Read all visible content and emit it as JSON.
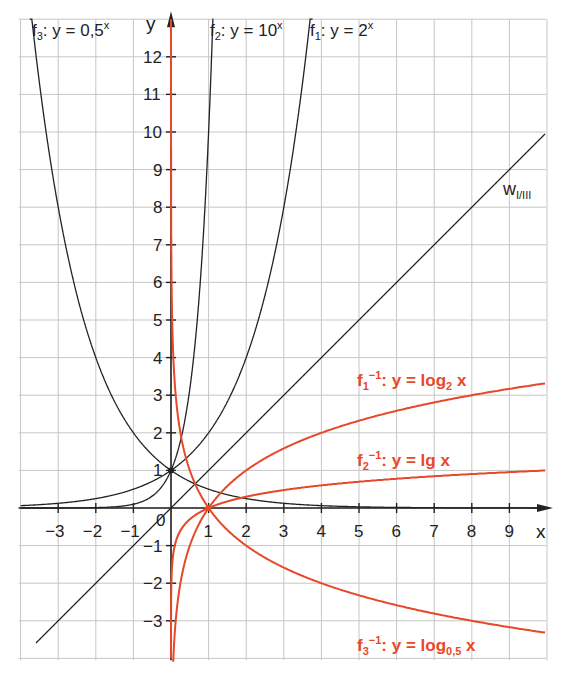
{
  "chart_data": {
    "type": "line",
    "title": "",
    "xlabel": "x",
    "ylabel": "y",
    "xlim": [
      -4,
      10
    ],
    "ylim": [
      -4,
      13
    ],
    "grid": true,
    "x_ticks": [
      -3,
      -2,
      -1,
      1,
      2,
      3,
      4,
      5,
      6,
      7,
      8,
      9
    ],
    "y_ticks": [
      -3,
      -2,
      -1,
      1,
      2,
      3,
      4,
      5,
      6,
      7,
      8,
      9,
      10,
      11,
      12
    ],
    "origin_label": "0",
    "series": [
      {
        "name": "f1: y = 2^x",
        "func": "pow2",
        "color": "#222222"
      },
      {
        "name": "f2: y = 10^x",
        "func": "pow10",
        "color": "#222222"
      },
      {
        "name": "f3: y = 0,5^x",
        "func": "pow05",
        "color": "#222222"
      },
      {
        "name": "w I/III: y = x",
        "func": "identity",
        "color": "#222222"
      },
      {
        "name": "f1^-1: y = log2 x",
        "func": "log2",
        "color": "#e8482a"
      },
      {
        "name": "f2^-1: y = lg x",
        "func": "log10",
        "color": "#e8482a"
      },
      {
        "name": "f3^-1: y = log0,5 x",
        "func": "log05",
        "color": "#e8482a"
      }
    ],
    "annotations": {
      "f3": {
        "name": "f",
        "sub": "3",
        "rest": ": y = 0,5",
        "sup": "x"
      },
      "f2": {
        "name": "f",
        "sub": "2",
        "rest": ": y = 10",
        "sup": "x"
      },
      "f1": {
        "name": "f",
        "sub": "1",
        "rest": ": y = 2",
        "sup": "x"
      },
      "w": {
        "name": "w",
        "sub": "I/III"
      },
      "inv1": {
        "name": "f",
        "sub": "1",
        "sup": "−1",
        "rest": ": y = log",
        "sub2": "2",
        "tail": " x"
      },
      "inv2": {
        "name": "f",
        "sub": "2",
        "sup": "−1",
        "rest": ": y = lg x"
      },
      "inv3": {
        "name": "f",
        "sub": "3",
        "sup": "−1",
        "rest": ": y = log",
        "sub2": "0,5",
        "tail": " x"
      }
    }
  }
}
